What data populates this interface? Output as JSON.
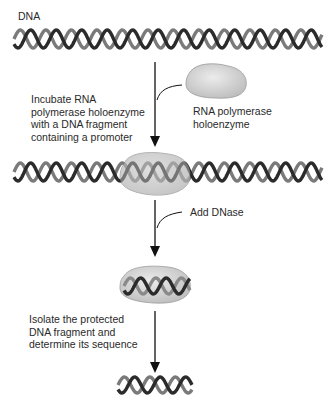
{
  "labels": {
    "dna": "DNA",
    "step1": "Incubate RNA\npolymerase holoenzyme\nwith a DNA fragment\ncontaining a promoter",
    "enzyme": "RNA polymerase\nholoenzyme",
    "step2": "Add DNase",
    "step3": "Isolate the protected\nDNA fragment and\ndetermine its sequence"
  },
  "colors": {
    "strand_dark": "#2b2b2b",
    "strand_light": "#7a7a7a",
    "enzyme_fill": "#d6d6d6",
    "arrow": "#111111"
  }
}
